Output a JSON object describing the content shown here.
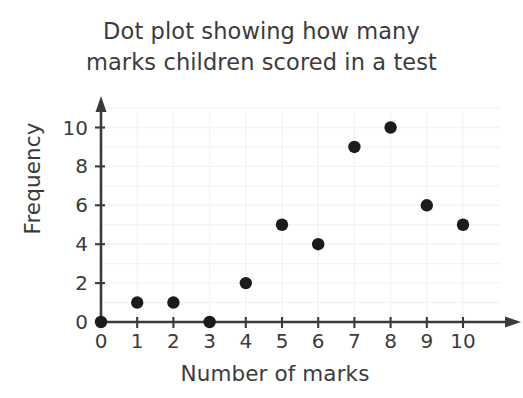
{
  "chart_data": {
    "type": "scatter",
    "title": "Dot plot showing how many marks children scored in a test",
    "title_line1": "Dot plot showing how many",
    "title_line2": "marks children scored in a test",
    "xlabel": "Number of marks",
    "ylabel": "Frequency",
    "x": [
      0,
      1,
      2,
      3,
      4,
      5,
      6,
      7,
      8,
      9,
      10
    ],
    "values": [
      0,
      1,
      1,
      0,
      2,
      5,
      4,
      9,
      10,
      6,
      5
    ],
    "points": [
      {
        "x": 0,
        "y": 0
      },
      {
        "x": 1,
        "y": 1
      },
      {
        "x": 2,
        "y": 1
      },
      {
        "x": 3,
        "y": 0
      },
      {
        "x": 4,
        "y": 2
      },
      {
        "x": 5,
        "y": 5
      },
      {
        "x": 6,
        "y": 4
      },
      {
        "x": 7,
        "y": 9
      },
      {
        "x": 8,
        "y": 10
      },
      {
        "x": 9,
        "y": 6
      },
      {
        "x": 10,
        "y": 5
      }
    ],
    "xlim": [
      0,
      10
    ],
    "ylim": [
      0,
      11
    ],
    "xticks": [
      "0",
      "1",
      "2",
      "3",
      "4",
      "5",
      "6",
      "7",
      "8",
      "9",
      "10"
    ],
    "xtick_values": [
      0,
      1,
      2,
      3,
      4,
      5,
      6,
      7,
      8,
      9,
      10
    ],
    "yticks": [
      "0",
      "2",
      "4",
      "6",
      "8",
      "10"
    ],
    "ytick_values": [
      0,
      2,
      4,
      6,
      8,
      10
    ],
    "grid": true,
    "legend": false,
    "colors": {
      "background": "#ffffff",
      "dot": "#1b1b1b",
      "axis": "#3a3a3a",
      "grid": "#f4f4f4",
      "text": "#3b3b3b"
    }
  }
}
